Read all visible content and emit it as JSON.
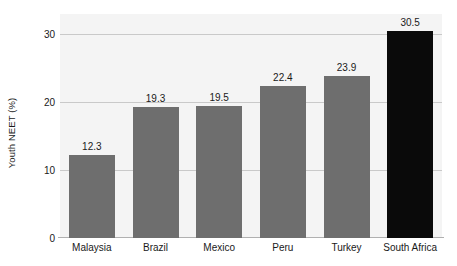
{
  "chart_data": {
    "type": "bar",
    "title": "",
    "subtitle": "",
    "xlabel": "",
    "ylabel": "Youth NEET (%)",
    "categories": [
      "Malaysia",
      "Brazil",
      "Mexico",
      "Peru",
      "Turkey",
      "South Africa"
    ],
    "values": [
      12.3,
      19.3,
      19.5,
      22.4,
      23.9,
      30.5
    ],
    "data_labels": [
      "12.3",
      "19.3",
      "19.5",
      "22.4",
      "23.9",
      "30.5"
    ],
    "ylim": [
      0,
      33
    ],
    "y_ticks": [
      0,
      10,
      20,
      30
    ],
    "y_tick_labels": [
      "0",
      "10",
      "20",
      "30"
    ],
    "grid": true,
    "grid_axis": "y",
    "legend": null,
    "legend_position": "none",
    "bar_colors": [
      "#6e6e6e",
      "#6e6e6e",
      "#6e6e6e",
      "#6e6e6e",
      "#6e6e6e",
      "#0a0a0a"
    ],
    "highlight_category": "South Africa",
    "series": [
      {
        "name": "Youth NEET (%)",
        "values": [
          12.3,
          19.3,
          19.5,
          22.4,
          23.9,
          30.5
        ]
      }
    ]
  },
  "style": {
    "plot_background": "#f4f4f4",
    "page_background": "#ffffff",
    "gridline_color": "#c9c9c9",
    "axis_color": "#b0b0b0",
    "bar_gray": "#6e6e6e",
    "bar_black": "#0a0a0a",
    "text_color": "#1a1a1a"
  }
}
